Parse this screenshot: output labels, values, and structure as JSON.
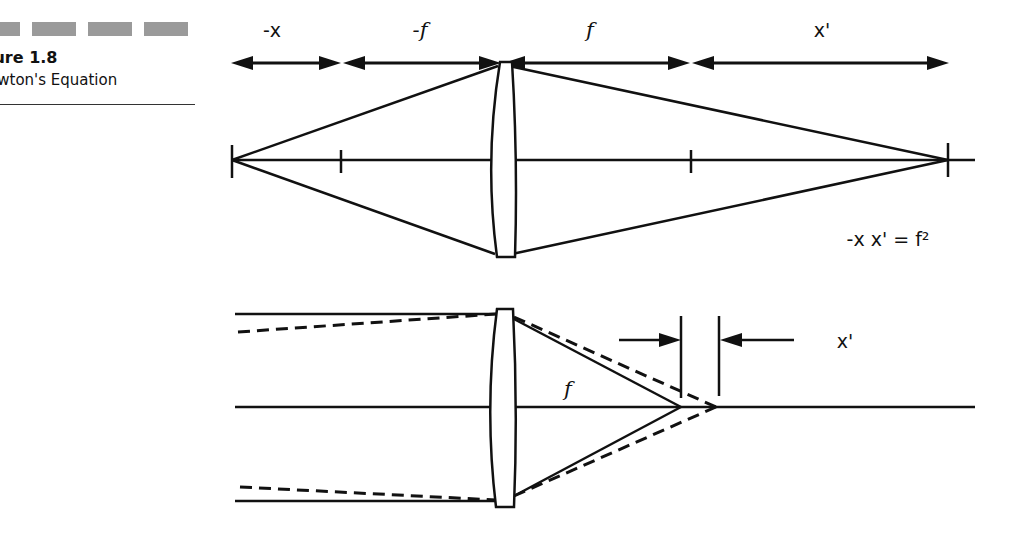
{
  "figure": {
    "label": "gure 1.8",
    "caption": "ewton's Equation"
  },
  "top_diagram": {
    "dimension_labels": [
      "-x",
      "-f",
      "f",
      "x'"
    ],
    "equation": "-x x' = f²"
  },
  "bottom_diagram": {
    "focal_label": "f",
    "shift_label": "x'"
  }
}
